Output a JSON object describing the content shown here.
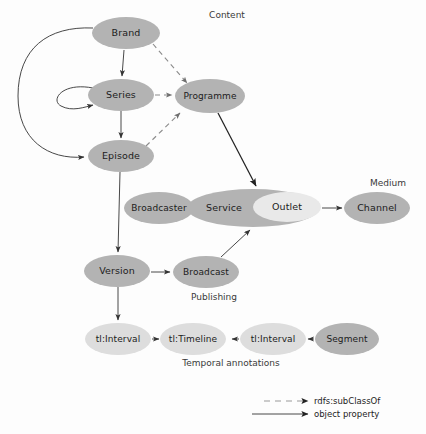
{
  "diagram": {
    "nodes": [
      {
        "id": "brand",
        "label": "Brand",
        "shade": "dark",
        "cx": 126,
        "cy": 33,
        "rx": 34,
        "ry": 16
      },
      {
        "id": "series",
        "label": "Series",
        "shade": "dark",
        "cx": 121,
        "cy": 95,
        "rx": 33,
        "ry": 16
      },
      {
        "id": "programme",
        "label": "Programme",
        "shade": "dark",
        "cx": 210,
        "cy": 96,
        "rx": 35,
        "ry": 17
      },
      {
        "id": "episode",
        "label": "Episode",
        "shade": "dark",
        "cx": 121,
        "cy": 156,
        "rx": 33,
        "ry": 16
      },
      {
        "id": "broadcaster",
        "label": "Broadcaster",
        "shade": "dark",
        "cx": 159,
        "cy": 208,
        "rx": 35,
        "ry": 16
      },
      {
        "id": "service",
        "label": "Service",
        "shade": "dark",
        "cx": 253,
        "cy": 208,
        "rx": 66,
        "ry": 19
      },
      {
        "id": "outlet",
        "label": "Outlet",
        "shade": "inner",
        "cx": 287,
        "cy": 207,
        "rx": 34,
        "ry": 15
      },
      {
        "id": "channel",
        "label": "Channel",
        "shade": "dark",
        "cx": 377,
        "cy": 208,
        "rx": 33,
        "ry": 16
      },
      {
        "id": "version",
        "label": "Version",
        "shade": "dark",
        "cx": 117,
        "cy": 271,
        "rx": 33,
        "ry": 16
      },
      {
        "id": "broadcast",
        "label": "Broadcast",
        "shade": "dark",
        "cx": 206,
        "cy": 272,
        "rx": 33,
        "ry": 16
      },
      {
        "id": "interval1",
        "label": "tl:Interval",
        "shade": "light",
        "cx": 118,
        "cy": 339,
        "rx": 33,
        "ry": 16
      },
      {
        "id": "timeline",
        "label": "tl:Timeline",
        "shade": "light",
        "cx": 193,
        "cy": 339,
        "rx": 33,
        "ry": 16
      },
      {
        "id": "interval2",
        "label": "tl:Interval",
        "shade": "light",
        "cx": 273,
        "cy": 339,
        "rx": 33,
        "ry": 16
      },
      {
        "id": "segment",
        "label": "Segment",
        "shade": "dark",
        "cx": 347,
        "cy": 339,
        "rx": 32,
        "ry": 16
      }
    ],
    "group_labels": [
      {
        "id": "content",
        "label": "Content",
        "x": 227,
        "y": 15
      },
      {
        "id": "medium",
        "label": "Medium",
        "x": 388,
        "y": 183
      },
      {
        "id": "publishing",
        "label": "Publishing",
        "x": 214,
        "y": 297
      },
      {
        "id": "temporal",
        "label": "Temporal annotations",
        "x": 231,
        "y": 363
      }
    ],
    "edges": [
      {
        "id": "brand-series",
        "from": "Brand",
        "to": "Series",
        "type": "object property"
      },
      {
        "id": "brand-episode",
        "from": "Brand",
        "to": "Episode",
        "type": "object property"
      },
      {
        "id": "series-series",
        "from": "Series",
        "to": "Series",
        "type": "object property"
      },
      {
        "id": "series-episode",
        "from": "Series",
        "to": "Episode",
        "type": "object property"
      },
      {
        "id": "brand-programme",
        "from": "Brand",
        "to": "Programme",
        "type": "rdfs:subClassOf"
      },
      {
        "id": "series-programme",
        "from": "Series",
        "to": "Programme",
        "type": "rdfs:subClassOf"
      },
      {
        "id": "episode-programme",
        "from": "Episode",
        "to": "Programme",
        "type": "rdfs:subClassOf"
      },
      {
        "id": "programme-outlet",
        "from": "Programme",
        "to": "Outlet",
        "type": "object property"
      },
      {
        "id": "broadcaster-service",
        "from": "Broadcaster",
        "to": "Service",
        "type": "object property"
      },
      {
        "id": "outlet-channel",
        "from": "Outlet",
        "to": "Channel",
        "type": "object property"
      },
      {
        "id": "episode-version",
        "from": "Episode",
        "to": "Version",
        "type": "object property"
      },
      {
        "id": "version-broadcast",
        "from": "Version",
        "to": "Broadcast",
        "type": "object property"
      },
      {
        "id": "broadcast-service",
        "from": "Broadcast",
        "to": "Service",
        "type": "object property"
      },
      {
        "id": "version-interval",
        "from": "Version",
        "to": "tl:Interval",
        "type": "object property"
      },
      {
        "id": "interval-timeline",
        "from": "tl:Interval",
        "to": "tl:Timeline",
        "type": "object property"
      },
      {
        "id": "interval2-timeline",
        "from": "tl:Interval",
        "to": "tl:Timeline",
        "type": "object property"
      },
      {
        "id": "segment-interval2",
        "from": "Segment",
        "to": "tl:Interval",
        "type": "object property"
      }
    ]
  },
  "legend": {
    "items": [
      {
        "id": "subclassof",
        "label": "rdfs:subClassOf",
        "style": "dashed"
      },
      {
        "id": "objectprop",
        "label": "object property",
        "style": "solid"
      }
    ]
  },
  "colors": {
    "node_dark": "#b3b3b3",
    "node_light": "#dddddd",
    "node_inner": "#e9e9e9",
    "edge_solid": "#333333",
    "edge_dashed": "#8b8b8b",
    "text": "#1c1c1c",
    "background": "#fdfdfd"
  }
}
